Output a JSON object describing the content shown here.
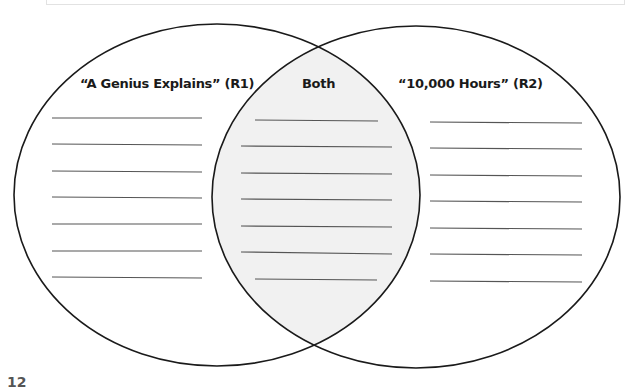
{
  "diagram": {
    "type": "venn",
    "labels": {
      "left": "“A Genius Explains” (R1)",
      "middle": "Both",
      "right": "“10,000 Hours” (R2)"
    },
    "left_lines": [
      118,
      144,
      171,
      197,
      224,
      251,
      277
    ],
    "middle_lines": [
      120,
      146,
      173,
      200,
      226,
      253,
      279
    ],
    "right_lines": [
      122,
      149,
      175,
      202,
      228,
      255,
      281
    ],
    "colors": {
      "outline": "#1a1a1a",
      "writing_line": "#555555",
      "intersection_fill": "#f1f1f1"
    }
  },
  "page": {
    "number": "12"
  }
}
